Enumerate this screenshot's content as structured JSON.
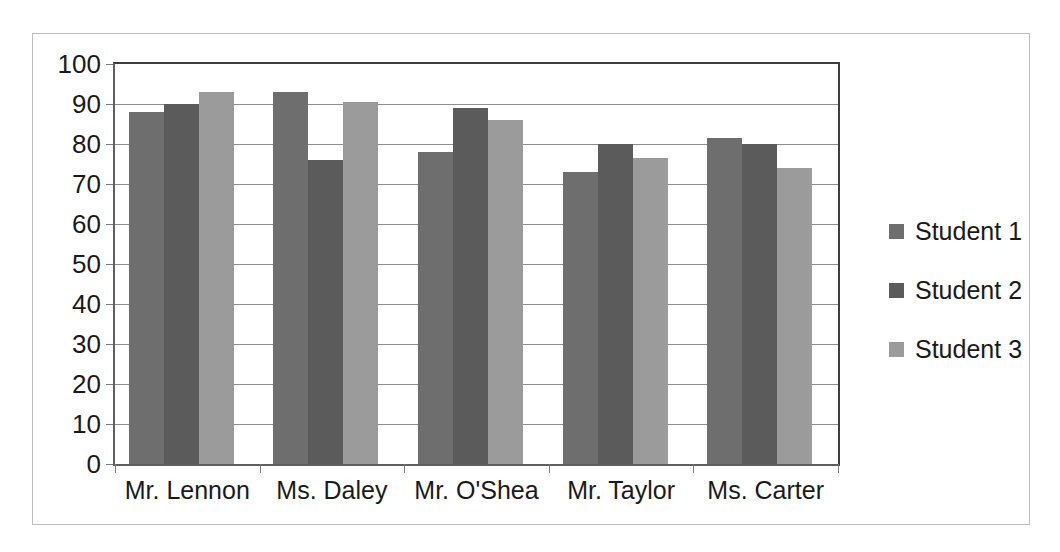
{
  "chart_data": {
    "type": "bar",
    "title": "",
    "subtitle": "",
    "xlabel": "",
    "ylabel": "",
    "ylim": [
      0,
      100
    ],
    "yticks": [
      0,
      10,
      20,
      30,
      40,
      50,
      60,
      70,
      80,
      90,
      100
    ],
    "ytick_labels": [
      "0",
      "10",
      "20",
      "30",
      "40",
      "50",
      "60",
      "70",
      "80",
      "90",
      "100"
    ],
    "grid": true,
    "grid_axis": "y",
    "legend_position": "right",
    "categories": [
      "Mr. Lennon",
      "Ms. Daley",
      "Mr. O'Shea",
      "Mr. Taylor",
      "Ms. Carter"
    ],
    "series": [
      {
        "name": "Student 1",
        "color": "#6e6e6e",
        "values": [
          88,
          93,
          78,
          73,
          81.5
        ]
      },
      {
        "name": "Student 2",
        "color": "#5b5b5b",
        "values": [
          90,
          76,
          89,
          80,
          80
        ]
      },
      {
        "name": "Student 3",
        "color": "#9b9b9b",
        "values": [
          93,
          90.5,
          86,
          76.5,
          74
        ]
      }
    ]
  },
  "style": {
    "frame_border_color": "#bfbfbf",
    "axis_color": "#5f5f5f",
    "gridline_color": "#8f8f8f",
    "text_color": "#1a1a1a",
    "background": "#ffffff"
  }
}
